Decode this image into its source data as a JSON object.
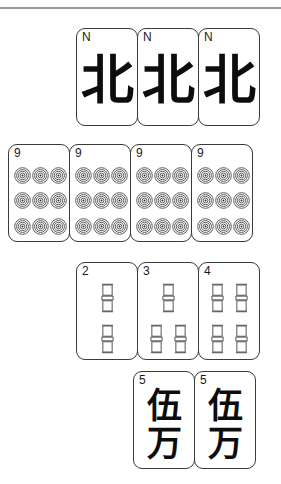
{
  "page": {
    "background_color": "#ffffff",
    "rule_color": "#9a9a9a",
    "tile_border_color": "#3a3a3a",
    "tile_face_color": "#ffffff",
    "glyph_color": "#0d0d0d"
  },
  "hand": {
    "rows": [
      {
        "name": "winds-row",
        "suit": "wind",
        "tiles": [
          {
            "rank_label": "N",
            "glyph": "北",
            "name": "north-wind-tile"
          },
          {
            "rank_label": "N",
            "glyph": "北",
            "name": "north-wind-tile"
          },
          {
            "rank_label": "N",
            "glyph": "北",
            "name": "north-wind-tile"
          }
        ]
      },
      {
        "name": "dots-row",
        "suit": "dots",
        "tiles": [
          {
            "rank_label": "9",
            "count": 9,
            "name": "nine-dots-tile"
          },
          {
            "rank_label": "9",
            "count": 9,
            "name": "nine-dots-tile"
          },
          {
            "rank_label": "9",
            "count": 9,
            "name": "nine-dots-tile"
          },
          {
            "rank_label": "9",
            "count": 9,
            "name": "nine-dots-tile"
          }
        ]
      },
      {
        "name": "bamboo-row",
        "suit": "bamboo",
        "tiles": [
          {
            "rank_label": "2",
            "count": 2,
            "name": "two-bamboo-tile"
          },
          {
            "rank_label": "3",
            "count": 3,
            "name": "three-bamboo-tile"
          },
          {
            "rank_label": "4",
            "count": 4,
            "name": "four-bamboo-tile"
          }
        ]
      },
      {
        "name": "characters-row",
        "suit": "characters",
        "tiles": [
          {
            "rank_label": "5",
            "glyph_top": "伍",
            "glyph_bottom": "万",
            "name": "five-characters-tile"
          },
          {
            "rank_label": "5",
            "glyph_top": "伍",
            "glyph_bottom": "万",
            "name": "five-characters-tile"
          }
        ]
      }
    ]
  }
}
